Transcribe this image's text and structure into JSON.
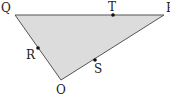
{
  "diagram": {
    "type": "geometry-triangle",
    "fill_color": "#dcdcdc",
    "stroke_color": "#444444",
    "vertices": {
      "Q": {
        "label": "Q",
        "x": 15,
        "y": 15
      },
      "P": {
        "label": "P",
        "x": 164,
        "y": 15
      },
      "O": {
        "label": "O",
        "x": 61,
        "y": 80
      }
    },
    "points": {
      "T": {
        "label": "T",
        "x": 113,
        "y": 15,
        "on_segment": "QP"
      },
      "R": {
        "label": "R",
        "x": 38,
        "y": 48,
        "on_segment": "QO"
      },
      "S": {
        "label": "S",
        "x": 95,
        "y": 60,
        "on_segment": "OP"
      }
    }
  }
}
